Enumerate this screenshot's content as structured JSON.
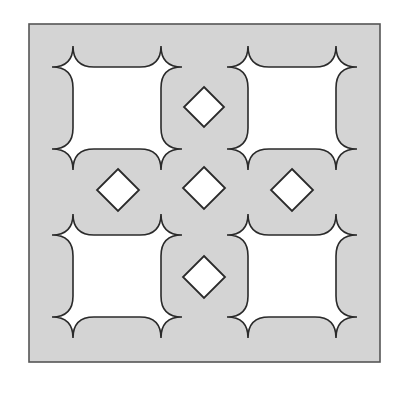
{
  "figure": {
    "colors": {
      "background": "#ffffff",
      "tile_fill": "#d4d4d4",
      "frame_stroke": "#555555",
      "shape_fill": "#ffffff",
      "shape_stroke": "#2a2a2a"
    },
    "frame": {
      "x": 29,
      "y": 24,
      "width": 351,
      "height": 338
    },
    "cusp_squares": [
      {
        "name": "top-left",
        "left": 52,
        "top": 46,
        "right": 182,
        "bottom": 170,
        "inset": 21
      },
      {
        "name": "top-right",
        "left": 227,
        "top": 46,
        "right": 357,
        "bottom": 170,
        "inset": 21
      },
      {
        "name": "bottom-left",
        "left": 52,
        "top": 214,
        "right": 182,
        "bottom": 338,
        "inset": 21
      },
      {
        "name": "bottom-right",
        "left": 227,
        "top": 214,
        "right": 357,
        "bottom": 338,
        "inset": 21
      }
    ],
    "diamonds": [
      {
        "name": "top",
        "cx": 204,
        "cy": 107,
        "r": 20
      },
      {
        "name": "left",
        "cx": 118,
        "cy": 190,
        "r": 21
      },
      {
        "name": "center",
        "cx": 204,
        "cy": 188,
        "r": 21
      },
      {
        "name": "right",
        "cx": 292,
        "cy": 190,
        "r": 21
      },
      {
        "name": "bottom",
        "cx": 204,
        "cy": 277,
        "r": 21
      }
    ]
  }
}
